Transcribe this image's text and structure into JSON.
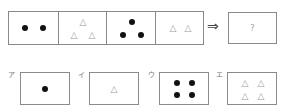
{
  "puzzle": {
    "sequence": [
      {
        "shape": "dot",
        "count": 2
      },
      {
        "shape": "triangle",
        "count": 3
      },
      {
        "shape": "dot",
        "count": 3
      },
      {
        "shape": "triangle",
        "count": 2
      }
    ],
    "arrow": "⇒",
    "answer_placeholder": "?",
    "triangle_glyph": "△"
  },
  "options": [
    {
      "label": "ア",
      "shape": "dot",
      "count": 1
    },
    {
      "label": "イ",
      "shape": "triangle",
      "count": 1
    },
    {
      "label": "ウ",
      "shape": "dot",
      "count": 4
    },
    {
      "label": "エ",
      "shape": "triangle",
      "count": 4
    }
  ]
}
